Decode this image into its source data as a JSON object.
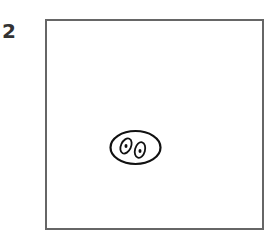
{
  "figure": {
    "label": "2",
    "frame_color": "#666666",
    "stroke_color": "#111111",
    "drawing": {
      "description": "hand-drawn oval with two eye-like ovals inside",
      "outer_oval": {
        "cx": 135.5,
        "cy": 147.5,
        "rx": 25,
        "ry": 17
      },
      "eyes": [
        {
          "cx": 126,
          "cy": 146,
          "rx": 5,
          "ry": 8,
          "rotate": 25
        },
        {
          "cx": 140,
          "cy": 150,
          "rx": 5,
          "ry": 8,
          "rotate": 15
        }
      ]
    }
  }
}
